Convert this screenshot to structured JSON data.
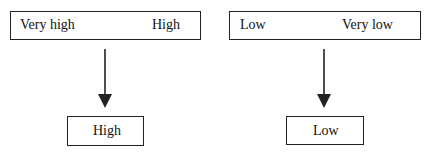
{
  "diagram": {
    "left": {
      "top_box": {
        "left_label": "Very high",
        "right_label": "High"
      },
      "result_box": {
        "label": "High"
      }
    },
    "right": {
      "top_box": {
        "left_label": "Low",
        "right_label": "Very low"
      },
      "result_box": {
        "label": "Low"
      }
    },
    "colors": {
      "stroke": "#222222",
      "background": "#ffffff",
      "text": "#111111"
    }
  }
}
